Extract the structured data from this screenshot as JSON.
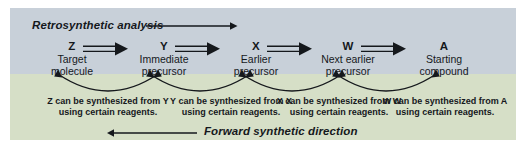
{
  "figure": {
    "top_label": "Retrosynthetic analysis",
    "bottom_label": "Forward synthetic direction",
    "colors": {
      "upper_band": "#c8d0d9",
      "lower_band": "#d6dfc7",
      "ink": "#15181c",
      "page": "#ffffff"
    },
    "retro_arrow_icon": "arrow-right-icon",
    "forward_arrow_icon": "arrow-left-icon",
    "step_arrow_icon": "retrosynthetic-double-arrow-icon",
    "curved_arrow_icon": "curved-double-headed-arrow-icon"
  },
  "species": [
    {
      "symbol": "Z",
      "description": "Target\nmolecule"
    },
    {
      "symbol": "Y",
      "description": "Immediate\nprecursor"
    },
    {
      "symbol": "X",
      "description": "Earlier\nprecursor"
    },
    {
      "symbol": "W",
      "description": "Next earlier\nprecursor"
    },
    {
      "symbol": "A",
      "description": "Starting\ncompound"
    }
  ],
  "captions": [
    {
      "line1": "Z can be synthesized from Y",
      "line2": "using certain reagents."
    },
    {
      "line1": "Y can be synthesized from X",
      "line2": "using certain reagents."
    },
    {
      "line1": "X can be synthesized from W",
      "line2": "using certain reagents."
    },
    {
      "line1": "W can be synthesized from A",
      "line2": "using certain reagents."
    }
  ]
}
